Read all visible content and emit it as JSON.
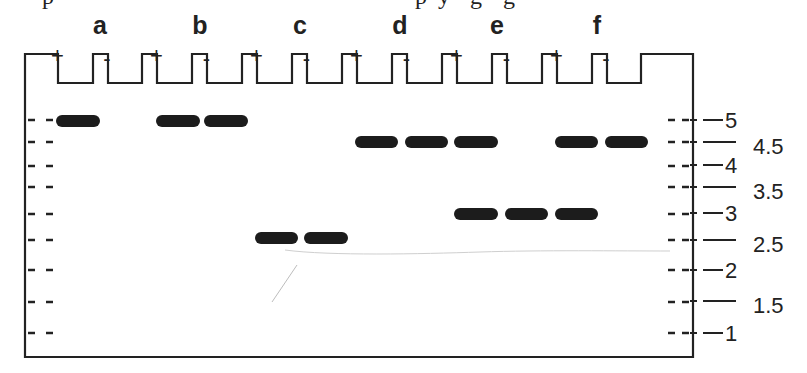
{
  "clipped_caption": {
    "fragments": [
      {
        "x": 42,
        "text": "p"
      },
      {
        "x": 415,
        "text": "p"
      },
      {
        "x": 438,
        "text": "y"
      },
      {
        "x": 470,
        "text": "g"
      },
      {
        "x": 503,
        "text": "g"
      }
    ]
  },
  "gel": {
    "outline_color": "#222222",
    "band_color": "#1c1c1c",
    "lanes": [
      {
        "label": "a",
        "x": 100
      },
      {
        "label": "b",
        "x": 200
      },
      {
        "label": "c",
        "x": 300
      },
      {
        "label": "d",
        "x": 400
      },
      {
        "label": "e",
        "x": 497
      },
      {
        "label": "f",
        "x": 597
      }
    ],
    "wells": [
      {
        "sign": "+",
        "lane": "a",
        "x0": 58,
        "x1": 93
      },
      {
        "sign": "-",
        "lane": "a",
        "x0": 108,
        "x1": 142
      },
      {
        "sign": "+",
        "lane": "b",
        "x0": 157,
        "x1": 192
      },
      {
        "sign": "-",
        "lane": "b",
        "x0": 207,
        "x1": 242
      },
      {
        "sign": "+",
        "lane": "c",
        "x0": 257,
        "x1": 292
      },
      {
        "sign": "-",
        "lane": "c",
        "x0": 307,
        "x1": 342
      },
      {
        "sign": "+",
        "lane": "d",
        "x0": 357,
        "x1": 392
      },
      {
        "sign": "-",
        "lane": "d",
        "x0": 407,
        "x1": 442
      },
      {
        "sign": "+",
        "lane": "e",
        "x0": 457,
        "x1": 492
      },
      {
        "sign": "-",
        "lane": "e",
        "x0": 507,
        "x1": 542
      },
      {
        "sign": "+",
        "lane": "f",
        "x0": 557,
        "x1": 592
      },
      {
        "sign": "-",
        "lane": "f",
        "x0": 607,
        "x1": 641
      }
    ],
    "bands": [
      {
        "x0": 56,
        "x1": 100,
        "size_kb": 5,
        "y": 121
      },
      {
        "x0": 156,
        "x1": 200,
        "size_kb": 5,
        "y": 121
      },
      {
        "x0": 204,
        "x1": 248,
        "size_kb": 5,
        "y": 121
      },
      {
        "x0": 255,
        "x1": 298,
        "size_kb": 2.5,
        "y": 238
      },
      {
        "x0": 304,
        "x1": 348,
        "size_kb": 2.5,
        "y": 238
      },
      {
        "x0": 355,
        "x1": 398,
        "size_kb": 4.5,
        "y": 142
      },
      {
        "x0": 405,
        "x1": 448,
        "size_kb": 4.5,
        "y": 142
      },
      {
        "x0": 454,
        "x1": 498,
        "size_kb": 4.5,
        "y": 142
      },
      {
        "x0": 454,
        "x1": 498,
        "size_kb": 3,
        "y": 214
      },
      {
        "x0": 505,
        "x1": 548,
        "size_kb": 3,
        "y": 214
      },
      {
        "x0": 555,
        "x1": 598,
        "size_kb": 3,
        "y": 214
      },
      {
        "x0": 555,
        "x1": 598,
        "size_kb": 4.5,
        "y": 142
      },
      {
        "x0": 605,
        "x1": 648,
        "size_kb": 4.5,
        "y": 142
      }
    ],
    "ladder_marks_y": [
      120,
      142,
      166,
      187,
      214,
      240,
      270,
      302,
      333
    ]
  },
  "size_scale": {
    "ticks": [
      {
        "label": "5",
        "y": 120,
        "long": false
      },
      {
        "label": "4.5",
        "y": 142,
        "long": true
      },
      {
        "label": "4",
        "y": 165,
        "long": false
      },
      {
        "label": "3.5",
        "y": 187,
        "long": true
      },
      {
        "label": "3",
        "y": 213,
        "long": false
      },
      {
        "label": "2.5",
        "y": 240,
        "long": true
      },
      {
        "label": "2",
        "y": 270,
        "long": false
      },
      {
        "label": "1.5",
        "y": 301,
        "long": true
      },
      {
        "label": "1",
        "y": 333,
        "long": false
      }
    ]
  }
}
